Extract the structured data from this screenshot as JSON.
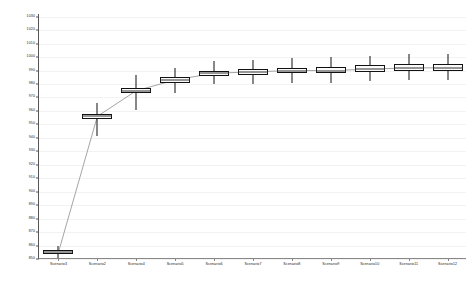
{
  "chart_data": {
    "type": "box",
    "title": "",
    "xlabel": "",
    "ylabel": "",
    "ylim": [
      850,
      1032
    ],
    "ytick_step": 10,
    "grid": true,
    "legend": false,
    "legend_position": "none",
    "connector_line": {
      "present": true,
      "color": "#9a9a9a",
      "connects": "medians"
    },
    "colors": {
      "box_fill": "#fbfbfb",
      "box_edge": "#111111",
      "median": "#333333",
      "whisker": "#111111",
      "gridline": "#f2f2f2",
      "axis": "#555555"
    },
    "yticks": [
      1030,
      1020,
      1010,
      1000,
      990,
      980,
      970,
      960,
      950,
      940,
      930,
      920,
      910,
      900,
      890,
      880,
      870,
      860,
      850
    ],
    "categories": [
      "Scenario3",
      "Scenario2",
      "Scenario4",
      "Scenario5",
      "Scenario6",
      "Scenario7",
      "Scenario8",
      "Scenario9",
      "Scenario10",
      "Scenario11",
      "Scenario12"
    ],
    "boxes": [
      {
        "category": "Scenario3",
        "whisker_low": 851,
        "q1": 854,
        "median": 855,
        "q3": 857,
        "whisker_high": 860
      },
      {
        "category": "Scenario2",
        "whisker_low": 941,
        "q1": 954,
        "median": 956,
        "q3": 958,
        "whisker_high": 966
      },
      {
        "category": "Scenario4",
        "whisker_low": 961,
        "q1": 973,
        "median": 975,
        "q3": 977,
        "whisker_high": 987
      },
      {
        "category": "Scenario5",
        "whisker_low": 973,
        "q1": 981,
        "median": 983,
        "q3": 985,
        "whisker_high": 992
      },
      {
        "category": "Scenario6",
        "whisker_low": 980,
        "q1": 986,
        "median": 988,
        "q3": 990,
        "whisker_high": 997
      },
      {
        "category": "Scenario7",
        "whisker_low": 980,
        "q1": 987,
        "median": 989,
        "q3": 991,
        "whisker_high": 998
      },
      {
        "category": "Scenario8",
        "whisker_low": 981,
        "q1": 988,
        "median": 990,
        "q3": 992,
        "whisker_high": 999
      },
      {
        "category": "Scenario9",
        "whisker_low": 981,
        "q1": 988,
        "median": 990,
        "q3": 993,
        "whisker_high": 1000
      },
      {
        "category": "Scenario10",
        "whisker_low": 982,
        "q1": 989,
        "median": 991,
        "q3": 994,
        "whisker_high": 1001
      },
      {
        "category": "Scenario11",
        "whisker_low": 983,
        "q1": 990,
        "median": 992,
        "q3": 995,
        "whisker_high": 1002
      },
      {
        "category": "Scenario12",
        "whisker_low": 983,
        "q1": 990,
        "median": 992,
        "q3": 995,
        "whisker_high": 1002
      }
    ]
  }
}
